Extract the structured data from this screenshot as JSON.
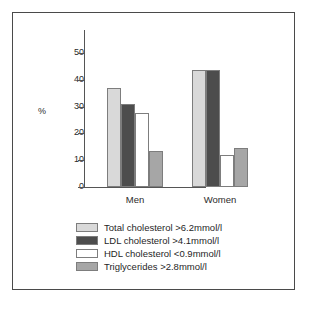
{
  "chart_data": {
    "type": "bar",
    "title": "",
    "xlabel": "",
    "ylabel": "%",
    "categories": [
      "Men",
      "Women"
    ],
    "ylim": [
      0,
      57
    ],
    "yticks": [
      0,
      10,
      20,
      30,
      40,
      50
    ],
    "ytick_labels": [
      "0",
      "10",
      "20",
      "30",
      "40",
      "50"
    ],
    "grid": false,
    "legend_position": "below",
    "series": [
      {
        "name": "Total cholesterol >6.2mmol/l",
        "color": "#d9d9d9",
        "values": [
          37,
          43.5
        ]
      },
      {
        "name": "LDL cholesterol >4.1mmol/l",
        "color": "#4d4d4d",
        "values": [
          31,
          43.5
        ]
      },
      {
        "name": "HDL cholesterol <0.9mmol/l",
        "color": "#ffffff",
        "values": [
          27.5,
          12
        ]
      },
      {
        "name": "Triglycerides >2.8mmol/l",
        "color": "#a6a6a6",
        "values": [
          13.5,
          14.5
        ]
      }
    ]
  },
  "style": {
    "frame_color": "#4a4a4a",
    "axis_color": "#555555",
    "bar_edge_color": "#7d7d7d",
    "text_color": "#1f1f1f",
    "background": "#ffffff"
  }
}
